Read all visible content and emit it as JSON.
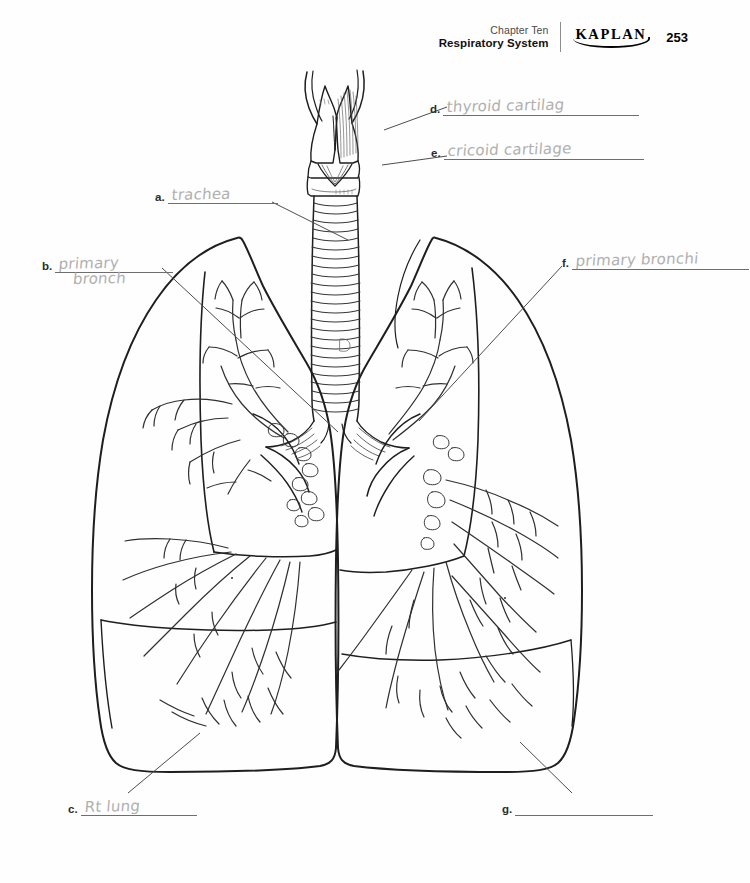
{
  "page": {
    "width": 750,
    "height": 883,
    "background": "#ffffff",
    "ink": "#1a1a1a",
    "pencil": "#b0b0ae"
  },
  "header": {
    "chapter_label": "Chapter Ten",
    "chapter_title": "Respiratory System",
    "brand": "KAPLAN",
    "page_number": "253"
  },
  "figure": {
    "type": "anatomy-worksheet"
  },
  "labels": [
    {
      "key": "a",
      "letter": "a.",
      "answer": "trachea",
      "answer_second_line": "",
      "filled": true,
      "slot_width": 110,
      "x": 155,
      "y": 186,
      "points_to": "trachea"
    },
    {
      "key": "b",
      "letter": "b.",
      "answer": "primary",
      "answer_second_line": "bronch",
      "filled": true,
      "slot_width": 118,
      "x": 42,
      "y": 255,
      "points_to": "left-primary-bronchus"
    },
    {
      "key": "c",
      "letter": "c.",
      "answer": "Rt lung",
      "answer_second_line": "",
      "filled": true,
      "slot_width": 116,
      "x": 68,
      "y": 798,
      "points_to": "right-lung"
    },
    {
      "key": "d",
      "letter": "d.",
      "answer": "thyroid cartilag",
      "answer_second_line": "",
      "filled": true,
      "slot_width": 196,
      "x": 430,
      "y": 98,
      "points_to": "thyroid-cartilage"
    },
    {
      "key": "e",
      "letter": "e.",
      "answer": "cricoid cartilage",
      "answer_second_line": "",
      "filled": true,
      "slot_width": 200,
      "x": 431,
      "y": 142,
      "points_to": "cricoid-cartilage"
    },
    {
      "key": "f",
      "letter": "f.",
      "answer": "primary bronchi",
      "answer_second_line": "",
      "filled": true,
      "slot_width": 177,
      "x": 562,
      "y": 252,
      "points_to": "right-primary-bronchus"
    },
    {
      "key": "g",
      "letter": "g.",
      "answer": "",
      "answer_second_line": "",
      "filled": false,
      "slot_width": 138,
      "x": 502,
      "y": 798,
      "points_to": "left-lung"
    }
  ],
  "leader_lines": [
    {
      "name": "leader-a",
      "x1": 272,
      "y1": 202,
      "x2": 348,
      "y2": 240
    },
    {
      "name": "leader-b",
      "x1": 160,
      "y1": 268,
      "x2": 338,
      "y2": 432
    },
    {
      "name": "leader-c",
      "x1": 128,
      "y1": 795,
      "x2": 200,
      "y2": 735
    },
    {
      "name": "leader-d",
      "x1": 446,
      "y1": 106,
      "x2": 384,
      "y2": 130
    },
    {
      "name": "leader-e",
      "x1": 446,
      "y1": 155,
      "x2": 382,
      "y2": 164
    },
    {
      "name": "leader-f",
      "x1": 562,
      "y1": 266,
      "x2": 418,
      "y2": 420
    },
    {
      "name": "leader-g",
      "x1": 572,
      "y1": 795,
      "x2": 520,
      "y2": 742
    }
  ]
}
